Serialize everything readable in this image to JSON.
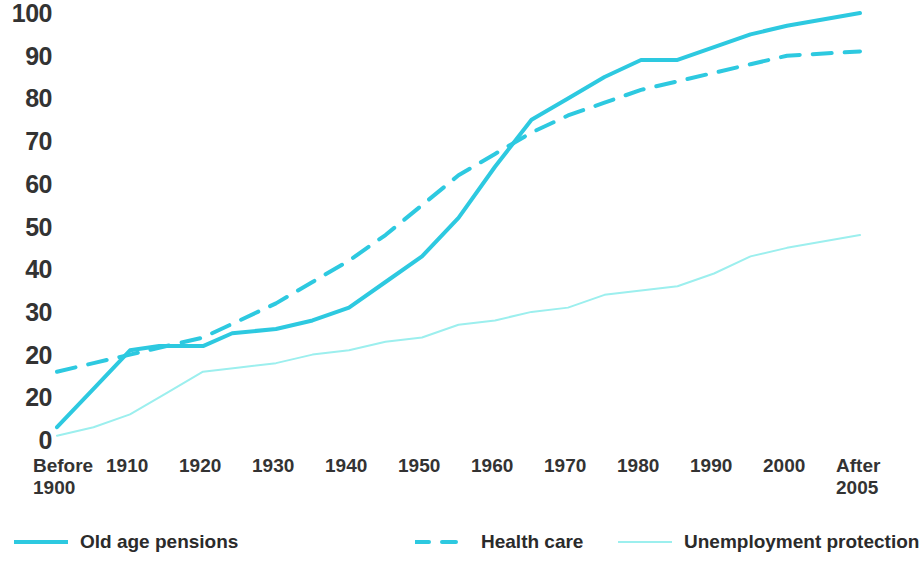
{
  "chart_data": {
    "type": "line",
    "title": "",
    "subtitle": "",
    "xlabel": "",
    "ylabel": "",
    "xlim": [
      0,
      11
    ],
    "ylim": [
      0,
      100
    ],
    "grid": false,
    "legend_position": "bottom",
    "categories": [
      "Before 1900",
      "1910",
      "1920",
      "1930",
      "1940",
      "1950",
      "1960",
      "1970",
      "1980",
      "1990",
      "2000",
      "After 2005"
    ],
    "x_tick_labels": [
      "Before\n1900",
      "1910",
      "1920",
      "1930",
      "1940",
      "1950",
      "1960",
      "1970",
      "1980",
      "1990",
      "2000",
      "After\n2005"
    ],
    "y_tick_labels": [
      "100",
      "90",
      "80",
      "70",
      "60",
      "50",
      "40",
      "30",
      "20",
      "20",
      "0"
    ],
    "y_tick_values": [
      100,
      90,
      80,
      70,
      60,
      50,
      40,
      30,
      20,
      10,
      0
    ],
    "series": [
      {
        "name": "Old age pensions",
        "style": "solid",
        "color": "#2DC9E0",
        "width": 4,
        "x": [
          0,
          0.5,
          1,
          1.4,
          2,
          2.4,
          3,
          3.5,
          4,
          4.5,
          5,
          5.5,
          6,
          6.5,
          7,
          7.5,
          8,
          8.5,
          9,
          9.5,
          10,
          11
        ],
        "values": [
          3,
          12,
          21,
          22,
          22,
          25,
          26,
          28,
          31,
          37,
          43,
          52,
          64,
          75,
          80,
          85,
          89,
          89,
          92,
          95,
          97,
          100
        ]
      },
      {
        "name": "Health care",
        "style": "dashed",
        "color": "#2DC9E0",
        "width": 4,
        "x": [
          0,
          0.5,
          1,
          1.5,
          2,
          2.5,
          3,
          3.5,
          4,
          4.5,
          5,
          5.5,
          6,
          6.5,
          7,
          7.5,
          8,
          8.5,
          9,
          9.5,
          10,
          11
        ],
        "values": [
          16,
          18,
          20,
          22,
          24,
          28,
          32,
          37,
          42,
          48,
          55,
          62,
          67,
          72,
          76,
          79,
          82,
          84,
          86,
          88,
          90,
          91
        ]
      },
      {
        "name": "Unemployment protection",
        "style": "solid",
        "color": "#9CEFEE",
        "width": 2,
        "x": [
          0,
          0.5,
          1,
          1.5,
          2,
          2.5,
          3,
          3.5,
          4,
          4.5,
          5,
          5.5,
          6,
          6.5,
          7,
          7.5,
          8,
          8.5,
          9,
          9.5,
          10,
          11
        ],
        "values": [
          1,
          3,
          6,
          11,
          16,
          17,
          18,
          20,
          21,
          23,
          24,
          27,
          28,
          30,
          31,
          34,
          35,
          36,
          39,
          43,
          45,
          48
        ]
      }
    ],
    "legend": [
      {
        "label": "Old age pensions",
        "style": "solid",
        "color": "#2DC9E0",
        "width": 4
      },
      {
        "label": "Health care",
        "style": "dashed",
        "color": "#2DC9E0",
        "width": 4
      },
      {
        "label": "Unemployment protection",
        "style": "solid",
        "color": "#9CEFEE",
        "width": 2
      }
    ]
  }
}
